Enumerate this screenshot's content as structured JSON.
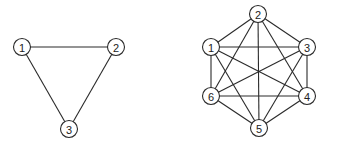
{
  "graphs": [
    {
      "name": "complete-graph-k3",
      "node_radius": 8.5,
      "nodes": [
        {
          "id": "1",
          "label": "1",
          "x": 22,
          "y": 47
        },
        {
          "id": "2",
          "label": "2",
          "x": 116,
          "y": 47
        },
        {
          "id": "3",
          "label": "3",
          "x": 69,
          "y": 129
        }
      ],
      "edges": [
        [
          "1",
          "2"
        ],
        [
          "1",
          "3"
        ],
        [
          "2",
          "3"
        ]
      ]
    },
    {
      "name": "complete-graph-k6",
      "node_radius": 8.5,
      "nodes": [
        {
          "id": "1",
          "label": "1",
          "x": 211,
          "y": 47
        },
        {
          "id": "2",
          "label": "2",
          "x": 258,
          "y": 14
        },
        {
          "id": "3",
          "label": "3",
          "x": 307,
          "y": 47
        },
        {
          "id": "4",
          "label": "4",
          "x": 307,
          "y": 96
        },
        {
          "id": "5",
          "label": "5",
          "x": 259,
          "y": 128
        },
        {
          "id": "6",
          "label": "6",
          "x": 211,
          "y": 96
        }
      ],
      "edges": [
        [
          "1",
          "2"
        ],
        [
          "1",
          "3"
        ],
        [
          "1",
          "4"
        ],
        [
          "1",
          "5"
        ],
        [
          "1",
          "6"
        ],
        [
          "2",
          "3"
        ],
        [
          "2",
          "4"
        ],
        [
          "2",
          "5"
        ],
        [
          "2",
          "6"
        ],
        [
          "3",
          "4"
        ],
        [
          "3",
          "5"
        ],
        [
          "3",
          "6"
        ],
        [
          "4",
          "5"
        ],
        [
          "4",
          "6"
        ],
        [
          "5",
          "6"
        ]
      ]
    }
  ],
  "colors": {
    "stroke": "#2a2a2a",
    "node_fill": "#ffffff",
    "label": "#222222"
  }
}
